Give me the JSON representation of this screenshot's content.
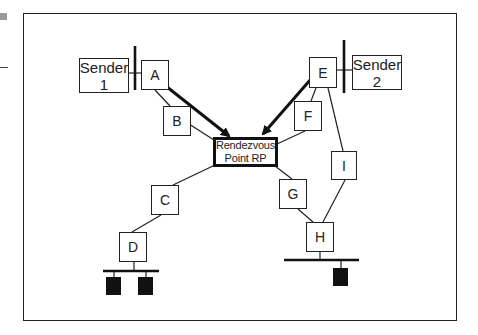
{
  "diagram": {
    "title": "",
    "senders": [
      {
        "id": "sender1",
        "line1": "Sender",
        "line2": "1"
      },
      {
        "id": "sender2",
        "line1": "Sender",
        "line2": "2"
      }
    ],
    "routers": [
      {
        "id": "A",
        "label": "A"
      },
      {
        "id": "B",
        "label": "B"
      },
      {
        "id": "C",
        "label": "C"
      },
      {
        "id": "D",
        "label": "D"
      },
      {
        "id": "E",
        "label": "E"
      },
      {
        "id": "F",
        "label": "F"
      },
      {
        "id": "G",
        "label": "G"
      },
      {
        "id": "H",
        "label": "H"
      },
      {
        "id": "I",
        "label": "I"
      }
    ],
    "rendezvous_point": {
      "line1": "Rendezvous",
      "line2": "Point  RP"
    },
    "links": [
      [
        "A",
        "B"
      ],
      [
        "B",
        "RP"
      ],
      [
        "E",
        "F"
      ],
      [
        "F",
        "RP"
      ],
      [
        "E",
        "I"
      ],
      [
        "RP",
        "C"
      ],
      [
        "C",
        "D"
      ],
      [
        "RP",
        "G"
      ],
      [
        "G",
        "H"
      ],
      [
        "I",
        "H"
      ]
    ],
    "register_arrows": [
      {
        "from": "A",
        "to": "RP",
        "style": "thick"
      },
      {
        "from": "E",
        "to": "RP",
        "style": "thick"
      }
    ],
    "receiver_lans": [
      {
        "router": "D",
        "hosts": 2
      },
      {
        "router": "H",
        "hosts": 1
      }
    ],
    "colors": {
      "stroke": "#222222",
      "host_fill": "#111111",
      "background": "#ffffff"
    }
  }
}
